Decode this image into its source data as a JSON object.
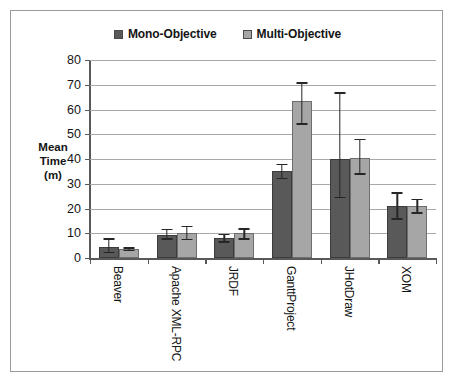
{
  "chart_data": {
    "type": "bar",
    "title": "",
    "xlabel": "",
    "ylabel": "Mean Time (m)",
    "ylabel_lines": [
      "Mean",
      "Time",
      "(m)"
    ],
    "categories": [
      "Beaver",
      "Apache XML-RPC",
      "JRDF",
      "GanttProject",
      "JHotDraw",
      "XOM"
    ],
    "ylim": [
      0,
      80
    ],
    "yticks": [
      0,
      10,
      20,
      30,
      40,
      50,
      60,
      70,
      80
    ],
    "ytick_labels": [
      "0",
      "10",
      "20",
      "30",
      "40",
      "50",
      "60",
      "70",
      "80"
    ],
    "grid": true,
    "legend_position": "top-center",
    "series": [
      {
        "name": "Mono-Objective",
        "color": "#595959",
        "values": [
          4.5,
          9.5,
          8.0,
          35.0,
          40.2,
          21.0
        ],
        "error_low": [
          2.5,
          8.0,
          6.8,
          32.5,
          24.8,
          16.0
        ],
        "error_high": [
          8.0,
          11.8,
          9.8,
          38.0,
          67.0,
          26.5
        ]
      },
      {
        "name": "Multi-Objective",
        "color": "#a6a6a6",
        "values": [
          3.8,
          10.3,
          10.0,
          63.5,
          40.5,
          21.0
        ],
        "error_low": [
          3.2,
          7.8,
          8.0,
          54.5,
          34.2,
          18.5
        ],
        "error_high": [
          4.3,
          13.0,
          12.0,
          71.0,
          48.2,
          24.0
        ]
      }
    ]
  },
  "legend": {
    "items": [
      {
        "label": "Mono-Objective",
        "color": "#595959"
      },
      {
        "label": "Multi-Objective",
        "color": "#a6a6a6"
      }
    ]
  }
}
